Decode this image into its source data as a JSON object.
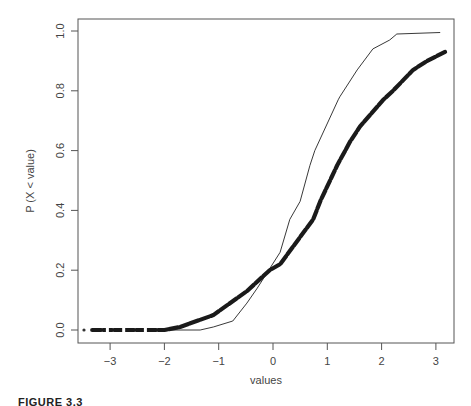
{
  "chart_data": {
    "type": "line",
    "title": "",
    "xlabel": "values",
    "ylabel": "P (X < value)",
    "xlim": [
      -3.45,
      3.35
    ],
    "ylim": [
      -0.04,
      1.04
    ],
    "xticks": [
      -3,
      -2,
      -1,
      0,
      1,
      2,
      3
    ],
    "xtick_labels": [
      "−3",
      "−2",
      "−1",
      "0",
      "1",
      "2",
      "3"
    ],
    "yticks": [
      0.0,
      0.2,
      0.4,
      0.6,
      0.8,
      1.0
    ],
    "ytick_labels": [
      "0.0",
      "0.2",
      "0.4",
      "0.6",
      "0.8",
      "1.0"
    ],
    "grid": false,
    "legend": null,
    "series": [
      {
        "name": "thin-line-cdf",
        "style": "thin-line",
        "x": [
          -3.3,
          -1.34,
          -1.1,
          -0.74,
          -0.48,
          -0.29,
          0.13,
          0.31,
          0.5,
          0.68,
          0.77,
          1.2,
          1.23,
          1.55,
          1.84,
          2.15,
          2.28,
          3.08
        ],
        "y": [
          0.0,
          0.0,
          0.01,
          0.03,
          0.09,
          0.14,
          0.26,
          0.37,
          0.43,
          0.55,
          0.6,
          0.77,
          0.78,
          0.87,
          0.94,
          0.97,
          0.99,
          0.995
        ]
      },
      {
        "name": "thick-points-ecdf",
        "style": "thick-points",
        "x": [
          -3.33,
          -2.0,
          -1.71,
          -1.1,
          -0.48,
          -0.06,
          0.13,
          0.74,
          0.87,
          1.18,
          1.42,
          1.6,
          2.03,
          2.21,
          2.58,
          2.84,
          3.17
        ],
        "y": [
          0.0,
          0.0,
          0.01,
          0.05,
          0.13,
          0.2,
          0.22,
          0.37,
          0.43,
          0.55,
          0.63,
          0.68,
          0.77,
          0.8,
          0.87,
          0.9,
          0.93
        ]
      }
    ]
  },
  "caption": "FIGURE 3.3"
}
